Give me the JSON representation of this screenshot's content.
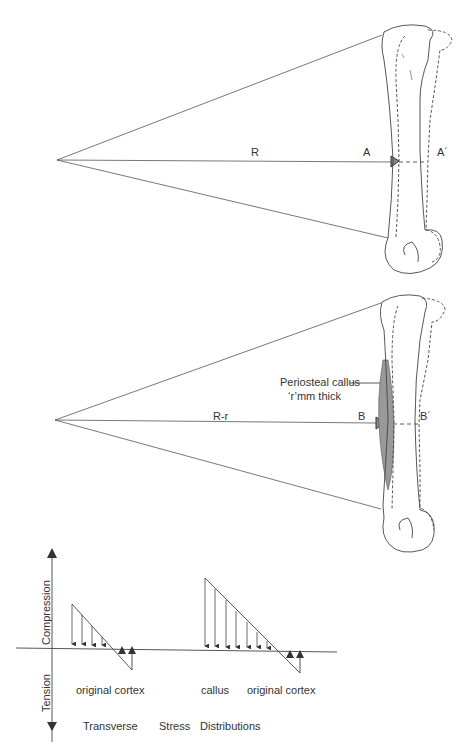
{
  "diagram": {
    "panel_a": {
      "radius_label": "R",
      "point_label": "A",
      "point_prime_label": "A´"
    },
    "panel_b": {
      "radius_label": "R-r",
      "point_label": "B",
      "point_prime_label": "B´",
      "callus_label_line1": "Periosteal callus",
      "callus_label_line2": "‘r’mm thick"
    },
    "stress_plot": {
      "axis_up_label": "Compression",
      "axis_down_label": "Tension",
      "left_label": "original cortex",
      "right_label_callus": "callus",
      "right_label_cortex": "original cortex",
      "caption_word1": "Transverse",
      "caption_word2": "Stress",
      "caption_word3": "Distributions"
    }
  }
}
